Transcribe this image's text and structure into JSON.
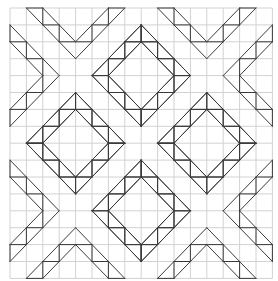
{
  "diagram": {
    "title": "",
    "type": "quilt-block-pattern",
    "grid": {
      "cols": 16,
      "rows": 16,
      "origin_x": 10,
      "origin_y": 8,
      "cell_w": 16.4,
      "cell_h": 16.9,
      "color": "#d2d2d2"
    },
    "line_color": "#3a3a3a",
    "diamonds": [
      {
        "cx": 8,
        "cy": 4,
        "outer_r": 3,
        "inner_r": 2
      },
      {
        "cx": 4,
        "cy": 8,
        "outer_r": 3,
        "inner_r": 2
      },
      {
        "cx": 12,
        "cy": 8,
        "outer_r": 3,
        "inner_r": 2
      },
      {
        "cx": 8,
        "cy": 12,
        "outer_r": 3,
        "inner_r": 2
      }
    ],
    "x_blocks": [
      {
        "cx": 4,
        "cy": 4
      },
      {
        "cx": 12,
        "cy": 4
      },
      {
        "cx": 4,
        "cy": 12
      },
      {
        "cx": 12,
        "cy": 12
      }
    ]
  }
}
